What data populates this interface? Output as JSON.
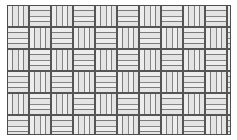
{
  "figure": {
    "canvas_width": 237,
    "canvas_height": 140
  },
  "panel": {
    "name": "paving-panel",
    "x": 7,
    "y": 5,
    "width": 223,
    "height": 129,
    "fill_color": "#f2f2f2",
    "border_color": "#4d4d4d",
    "border_width": 1
  },
  "pattern": {
    "type": "basketweave",
    "block_size": 22,
    "slats_per_block": 4,
    "slat_fill_color": "#ededed",
    "slat_alt_fill_color": "#e4e4e4",
    "slat_line_color": "#7a7a7a",
    "block_line_color": "#555555",
    "slat_line_width": 0.9,
    "block_line_width": 1.1,
    "columns": 11,
    "rows": 6,
    "orientation_start": "vertical"
  },
  "colors": {
    "background": "#ffffff",
    "mortar": "#fafafa",
    "stroke_dark": "#4d4d4d",
    "stroke_mid": "#7a7a7a",
    "stroke_light": "#a8a8a8"
  }
}
